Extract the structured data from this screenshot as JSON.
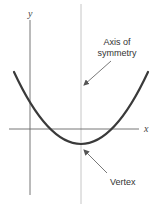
{
  "diagram": {
    "type": "parabola-axis-of-symmetry",
    "axes": {
      "x_label": "x",
      "y_label": "y"
    },
    "annotations": {
      "axis_of_symmetry": [
        "Axis of",
        "symmetry"
      ],
      "vertex": "Vertex"
    },
    "colors": {
      "curve": "#3a3a3a",
      "axes": "#555555",
      "symmetry_line": "#b0b0b0",
      "arrows": "#555555",
      "text": "#333333"
    }
  }
}
